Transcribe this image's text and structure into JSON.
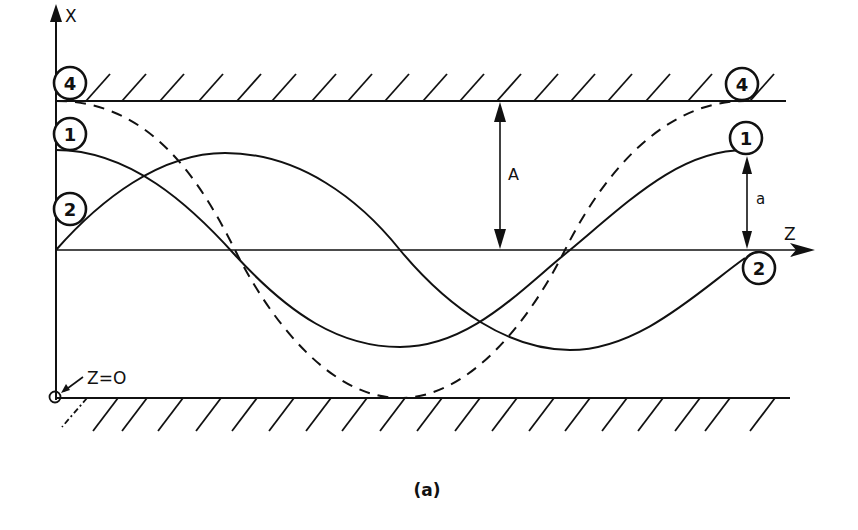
{
  "figure": {
    "caption": "(a)",
    "axes": {
      "x_label": "X",
      "z_label": "Z",
      "origin_label": "Z=O"
    },
    "dimensions": {
      "large_amplitude": "A",
      "small_amplitude": "a"
    },
    "curve_markers": [
      {
        "id": "4",
        "label": "4",
        "style": "dashed",
        "description": "full-amplitude wave touching upper and lower walls"
      },
      {
        "id": "1",
        "label": "1",
        "style": "solid",
        "description": "cosine-like wave of amplitude a starting at crest"
      },
      {
        "id": "2",
        "label": "2",
        "style": "solid",
        "description": "sine-like wave of amplitude a starting at centerline"
      }
    ],
    "walls": {
      "upper": "hatched boundary at x = +A",
      "lower": "hatched boundary at x = -A"
    }
  }
}
